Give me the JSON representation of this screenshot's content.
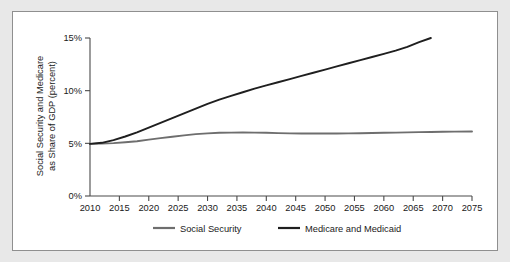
{
  "chart_data": {
    "type": "line",
    "title": "",
    "xlabel": "",
    "ylabel": "Social Security and Medicare as Share of GDP (percent)",
    "ylabel_line1": "Social Security and Medicare",
    "ylabel_line2": "as Share of GDP (percent)",
    "xlim": [
      2010,
      2075
    ],
    "ylim": [
      0,
      15
    ],
    "grid": false,
    "legend_position": "bottom",
    "x_ticks": [
      2010,
      2015,
      2020,
      2025,
      2030,
      2035,
      2040,
      2045,
      2050,
      2055,
      2060,
      2065,
      2070,
      2075
    ],
    "x_tick_labels": [
      "2010",
      "2015",
      "2020",
      "2025",
      "2030",
      "2035",
      "2040",
      "2045",
      "2050",
      "2055",
      "2060",
      "2065",
      "2070",
      "2075"
    ],
    "y_ticks": [
      0,
      5,
      10,
      15
    ],
    "y_tick_labels": [
      "0%",
      "5%",
      "10%",
      "15%"
    ],
    "series": [
      {
        "name": "Social Security",
        "color": "#6e6e6e",
        "x": [
          2010,
          2012,
          2014,
          2016,
          2018,
          2020,
          2022,
          2024,
          2026,
          2028,
          2030,
          2032,
          2034,
          2036,
          2038,
          2040,
          2042,
          2044,
          2046,
          2048,
          2050,
          2052,
          2054,
          2056,
          2058,
          2060,
          2062,
          2064,
          2066,
          2068,
          2070,
          2072,
          2075
        ],
        "values": [
          4.95,
          4.98,
          5.02,
          5.1,
          5.2,
          5.35,
          5.5,
          5.63,
          5.76,
          5.87,
          5.95,
          6.0,
          6.02,
          6.03,
          6.02,
          6.0,
          5.97,
          5.95,
          5.94,
          5.93,
          5.93,
          5.94,
          5.95,
          5.96,
          5.98,
          6.0,
          6.02,
          6.04,
          6.06,
          6.08,
          6.1,
          6.11,
          6.12
        ]
      },
      {
        "name": "Medicare and Medicaid",
        "color": "#1f1f1f",
        "x": [
          2010,
          2012,
          2014,
          2016,
          2018,
          2020,
          2022,
          2024,
          2026,
          2028,
          2030,
          2032,
          2034,
          2036,
          2038,
          2040,
          2042,
          2044,
          2046,
          2048,
          2050,
          2052,
          2054,
          2056,
          2058,
          2060,
          2062,
          2064,
          2066,
          2068
        ],
        "values": [
          4.95,
          5.05,
          5.3,
          5.65,
          6.05,
          6.5,
          6.95,
          7.4,
          7.85,
          8.3,
          8.75,
          9.15,
          9.5,
          9.85,
          10.2,
          10.5,
          10.8,
          11.1,
          11.4,
          11.7,
          12.0,
          12.3,
          12.6,
          12.9,
          13.2,
          13.5,
          13.8,
          14.15,
          14.6,
          15.0
        ]
      }
    ],
    "legend": [
      {
        "label": "Social Security",
        "color": "#6e6e6e"
      },
      {
        "label": "Medicare and Medicaid",
        "color": "#1f1f1f"
      }
    ]
  },
  "colors": {
    "page_background": "#e8e8e8",
    "panel_background": "#ffffff",
    "panel_border": "#8f8f8f",
    "axis": "#4a4a4a",
    "text": "#1a1a1a"
  }
}
